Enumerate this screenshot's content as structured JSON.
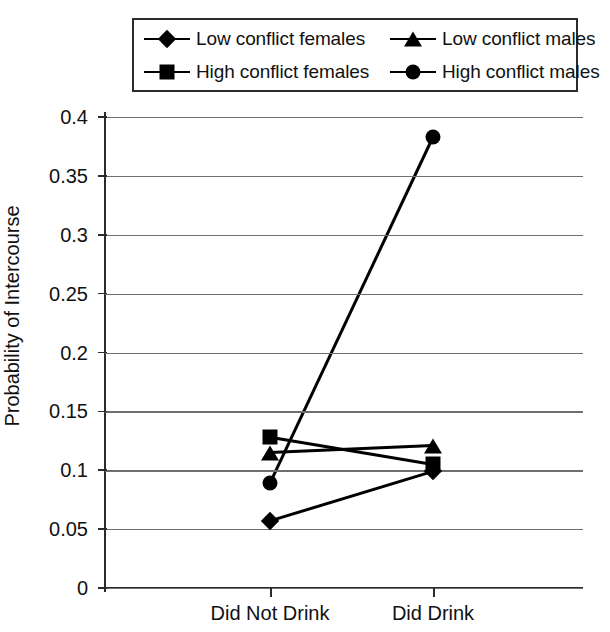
{
  "chart_data": {
    "type": "line",
    "title": "",
    "xlabel": "",
    "ylabel": "Probability of Intercourse",
    "categories": [
      "Did Not Drink",
      "Did Drink"
    ],
    "ylim": [
      0,
      0.4
    ],
    "yticks": [
      0,
      0.05,
      0.1,
      0.15,
      0.2,
      0.25,
      0.3,
      0.35,
      0.4
    ],
    "ytick_labels": [
      "0",
      "0.05",
      "0.1",
      "0.15",
      "0.2",
      "0.25",
      "0.3",
      "0.35",
      "0.4"
    ],
    "grid": true,
    "legend_position": "top",
    "series": [
      {
        "name": "Low conflict females",
        "marker": "diamond",
        "values": [
          0.057,
          0.099
        ]
      },
      {
        "name": "High conflict females",
        "marker": "square",
        "values": [
          0.128,
          0.105
        ]
      },
      {
        "name": "Low conflict males",
        "marker": "triangle",
        "values": [
          0.115,
          0.121
        ]
      },
      {
        "name": "High conflict males",
        "marker": "circle",
        "values": [
          0.089,
          0.383
        ]
      }
    ],
    "colors": {
      "ink": "#000000",
      "grid": "#6e6e6e",
      "axis": "#2b2b2b"
    }
  },
  "legend": {
    "items": [
      {
        "label": "Low conflict females",
        "marker": "diamond"
      },
      {
        "label": "Low conflict males",
        "marker": "triangle"
      },
      {
        "label": "High conflict females",
        "marker": "square"
      },
      {
        "label": "High conflict males",
        "marker": "circle"
      }
    ]
  }
}
